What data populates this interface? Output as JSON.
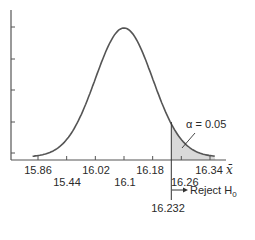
{
  "chart_data": {
    "type": "area",
    "title": "",
    "xlabel": "x̄",
    "ylabel": "",
    "x_ticks_row1": [
      "15.86",
      "16.02",
      "16.18",
      "16.34"
    ],
    "x_ticks_row2": [
      "15.44",
      "16.1",
      "16.26"
    ],
    "x_tick_values": [
      15.86,
      15.94,
      16.02,
      16.1,
      16.18,
      16.26,
      16.34
    ],
    "xlim": [
      15.82,
      16.38
    ],
    "mean": 16.1,
    "critical_value": 16.232,
    "critical_label": "16.232",
    "shaded_region": "x̄ > 16.232",
    "alpha_label": "α = 0.05",
    "alpha": 0.05,
    "reject_label": "Reject H",
    "reject_subscript": "0",
    "arrow": "→",
    "y_ticks_count": 5,
    "grid": false,
    "colors": {
      "curve": "#555555",
      "shade": "#d9d9d9",
      "axis": "#555555",
      "text": "#2a2a2a"
    }
  }
}
